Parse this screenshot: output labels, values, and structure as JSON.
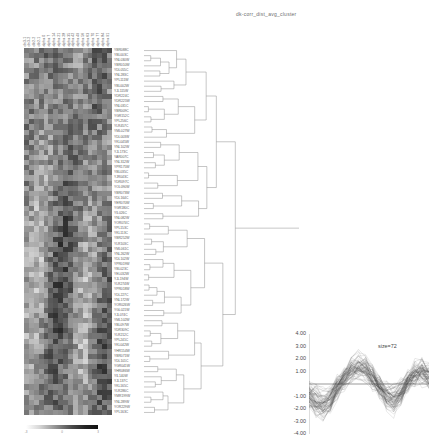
{
  "figure": {
    "title": "dk-corr_dist_avg_cluster",
    "type": "hierarchical-clustering-heatmap"
  },
  "heatmap": {
    "column_headers": [
      "cln3-1",
      "cln3-2",
      "clb2-2",
      "clb2-1",
      "alpha 0",
      "alpha 7",
      "alpha 14",
      "alpha 21",
      "alpha 28",
      "alpha 35",
      "alpha 42",
      "alpha 49",
      "alpha 56",
      "alpha 63",
      "alpha 70",
      "alpha 77",
      "alpha 84",
      "alpha 91"
    ],
    "row_labels": [
      "YBR088C",
      "YBL003C",
      "YNL030W",
      "YBR010W",
      "YDL055C",
      "YNL283C",
      "YPL111W",
      "YBL002W",
      "YJL115W",
      "YDR224C",
      "YDR225W",
      "YNL031C",
      "YBR009C",
      "YGR152C",
      "YPL256C",
      "YLR457C",
      "YML027W",
      "YDL003W",
      "YKL045W",
      "YNL102W",
      "YJL173C",
      "YAR007C",
      "YNL312W",
      "YPR175W",
      "YBL035C",
      "YJR043C",
      "YDR097C",
      "YOL090W",
      "YBR073W",
      "YDL164C",
      "YER070W",
      "YGR180C",
      "YIL026C",
      "YNL082W",
      "YOR074C",
      "YPL153C",
      "YKL113C",
      "YBR252W",
      "YLR103C",
      "YML061C",
      "YNL262W",
      "YDL102W",
      "YPR019W",
      "YBL023C",
      "YEL032W",
      "YJL194W",
      "YLR274W",
      "YPR018W",
      "YDL227C",
      "YNL172W",
      "YOR026W",
      "YGL021W",
      "YJL074C",
      "YML102W",
      "YBL097W",
      "YDR309C",
      "YLR212C",
      "YPL241C",
      "YKL042W",
      "YHR154W",
      "YBR071W",
      "YDL101C",
      "YGR041W",
      "YHR086W",
      "YIL140W",
      "YJL137C",
      "YKL165C",
      "YLR286C",
      "YMR199W",
      "YNL289W",
      "YOR229W",
      "YPL163C"
    ],
    "rows": 72,
    "columns": 18,
    "colorscale": {
      "type": "grayscale",
      "low": "#ffffff",
      "high": "#111111",
      "ticks": [
        "-3",
        "0",
        "3"
      ]
    }
  },
  "dendrogram": {
    "orientation": "horizontal",
    "leaf_count": 72,
    "linkage": "average",
    "distance": "correlation"
  },
  "chart_data": {
    "type": "line",
    "title": "",
    "xlabel": "",
    "ylabel": "",
    "ylim": [
      -4.0,
      4.0
    ],
    "grid": false,
    "legend": "size=72",
    "size_label": "size=72",
    "n_profiles": 72,
    "ytick_labels": [
      "4.00",
      "3.00",
      "2.00",
      "1.00",
      "-1.00",
      "-2.00",
      "-3.00",
      "-4.00"
    ],
    "ytick_values": [
      4.0,
      3.0,
      2.0,
      1.0,
      -1.0,
      -2.0,
      -3.0,
      -4.0
    ],
    "x": [
      0,
      1,
      2,
      3,
      4,
      5,
      6,
      7,
      8,
      9,
      10,
      11,
      12,
      13,
      14,
      15,
      16,
      17
    ],
    "mean_profile": [
      -0.75,
      -1.2,
      -1.45,
      -1.05,
      -0.3,
      0.45,
      0.95,
      1.2,
      1.05,
      0.55,
      -0.2,
      -0.85,
      -1.1,
      -0.6,
      0.15,
      0.7,
      0.95,
      0.6
    ]
  }
}
